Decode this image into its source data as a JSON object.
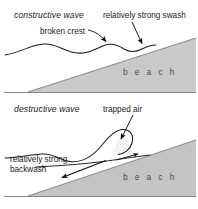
{
  "figure": {
    "width": 198,
    "height": 209
  },
  "colors": {
    "beach_fill": "#c9c9c9",
    "beach_fill_lower": "#c4c4c4",
    "line": "#1a1a1a",
    "baseline": "#8a8a8a",
    "background": "#ffffff",
    "text": "#1a1a1a",
    "beach_text": "#4a4a4a"
  },
  "panels": [
    {
      "id": "constructive",
      "title": "constructive wave",
      "labels": {
        "crest": "broken crest",
        "swash": "relatively strong swash",
        "beach": "b e a c h"
      },
      "annotations": [
        {
          "name": "broken-crest-arrow",
          "points_to": "wave crest"
        },
        {
          "name": "swash-arrow",
          "points_to": "swash run-up on beach"
        }
      ]
    },
    {
      "id": "destructive",
      "title": "destructive wave",
      "labels": {
        "trapped_air": "trapped air",
        "backwash": "relatively strong\nbackwash",
        "backwash_line1": "relatively strong",
        "backwash_line2": "backwash",
        "beach": "b e a c h"
      },
      "annotations": [
        {
          "name": "trapped-air-arrow",
          "points_to": "air pocket under plunging wave"
        },
        {
          "name": "backwash-arrow",
          "points_to": "down-slope backwash flow"
        },
        {
          "name": "swash-arrow-small",
          "points_to": "short swash up beach"
        }
      ]
    }
  ]
}
